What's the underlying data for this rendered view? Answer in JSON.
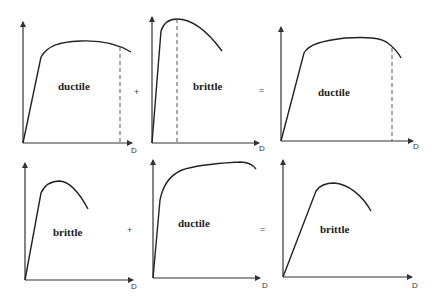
{
  "diagram": {
    "rows": [
      {
        "panels": [
          {
            "id": "top-left",
            "label": "ductile",
            "axis_label": "D"
          },
          {
            "id": "top-middle",
            "label": "brittle",
            "axis_label": "D"
          },
          {
            "id": "top-right",
            "label": "ductile",
            "axis_label": "D"
          }
        ],
        "operators": [
          "+",
          "="
        ]
      },
      {
        "panels": [
          {
            "id": "bottom-left",
            "label": "brittle",
            "axis_label": "D"
          },
          {
            "id": "bottom-middle",
            "label": "ductile",
            "axis_label": "D"
          },
          {
            "id": "bottom-right",
            "label": "brittle",
            "axis_label": "D"
          }
        ],
        "operators": [
          "+",
          "="
        ]
      }
    ]
  }
}
